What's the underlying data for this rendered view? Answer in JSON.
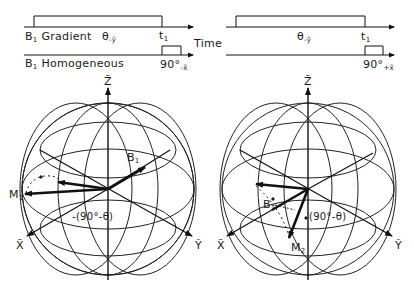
{
  "timing": {
    "row1_label": "B",
    "row1_label_sub": "1",
    "row1_label_rest": " Gradient",
    "row2_label": "B",
    "row2_label_sub": "1",
    "row2_label_rest": " Homogeneous",
    "time_label": "Time",
    "left": {
      "pulse_label": "θ",
      "pulse_label_sub": "-ỹ",
      "t_label": "t",
      "t_label_sub": "1",
      "hard_pulse_label": "90°",
      "hard_pulse_label_sub": "-x̃"
    },
    "right": {
      "pulse_label": "θ",
      "pulse_label_sub": "-ỹ",
      "t_label": "t",
      "t_label_sub": "1",
      "hard_pulse_label": "90°",
      "hard_pulse_label_sub": "+x̃"
    }
  },
  "spheres": {
    "left": {
      "z_axis": "Z̃",
      "x_axis": "X̃",
      "y_axis": "Ỹ",
      "field_vector": "B",
      "field_vector_sub": "1",
      "magnetization": "M",
      "magnetization_sub": "1",
      "angle_label": "-(90°-θ)"
    },
    "right": {
      "z_axis": "Z̃",
      "x_axis": "X̃",
      "y_axis": "Ỹ",
      "field_vector": "B",
      "field_vector_sub": "1",
      "magnetization": "M",
      "magnetization_sub": "2",
      "angle_label": "(90°-θ)"
    }
  }
}
